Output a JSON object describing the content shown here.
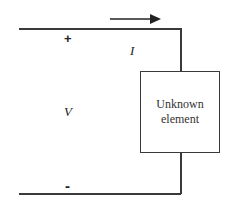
{
  "diagram": {
    "type": "circuit",
    "element": {
      "label_line1": "Unknown",
      "label_line2": "element"
    },
    "current": {
      "symbol": "I",
      "direction": "right"
    },
    "voltage": {
      "symbol": "V",
      "positive_sign": "+",
      "negative_sign": "-"
    },
    "colors": {
      "wire": "#3a3a3a",
      "background": "#ffffff"
    }
  }
}
